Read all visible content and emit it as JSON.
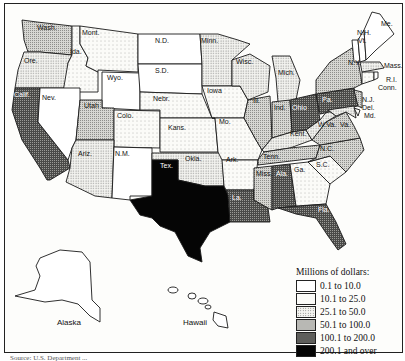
{
  "legend": {
    "title": "Millions of dollars:",
    "items": [
      {
        "label": "0.1 to 10.0",
        "pattern": "blank",
        "color": "#ffffff"
      },
      {
        "label": "10.1 to 25.0",
        "pattern": "sparse-dots",
        "color": "#f2f2ef"
      },
      {
        "label": "25.1 to 50.0",
        "pattern": "dense-dots",
        "color": "#e2e2dc"
      },
      {
        "label": "50.1 to 100.0",
        "pattern": "light-crosshatch",
        "color": "#bdbdb8"
      },
      {
        "label": "100.1 to 200.0",
        "pattern": "dark-crosshatch",
        "color": "#6a6a66"
      },
      {
        "label": "200.1 and over",
        "pattern": "solid",
        "color": "#050505"
      }
    ]
  },
  "insets": {
    "alaska": "Alaska",
    "hawaii": "Hawaii"
  },
  "source_text": "Source: U.S. Department ...",
  "states": {
    "wash": "Wash.",
    "ore": "Ore.",
    "calif": "Calif.",
    "ida": "Ida.",
    "nev": "Nev.",
    "mont": "Mont.",
    "wyo": "Wyo.",
    "utah": "Utah",
    "colo": "Colo.",
    "ariz": "Ariz.",
    "nm": "N.M.",
    "nd": "N.D.",
    "sd": "S.D.",
    "nebr": "Nebr.",
    "kans": "Kans.",
    "okla": "Okla.",
    "tex": "Tex.",
    "minn": "Minn.",
    "iowa": "Iowa",
    "mo": "Mo.",
    "ark": "Ark.",
    "la": "La.",
    "wisc": "Wisc.",
    "ill": "Ill.",
    "mich": "Mich.",
    "ind": "Ind.",
    "ohio": "Ohio",
    "kent": "Kent.",
    "tenn": "Tenn.",
    "miss": "Miss.",
    "ala": "Ala.",
    "ga": "Ga.",
    "fla": "Fla.",
    "sc": "S.C.",
    "nc": "N.C.",
    "va": "Va.",
    "wva": "W.Va.",
    "pa": "Pa.",
    "ny": "N.Y.",
    "nj": "N.J.",
    "del": "Del.",
    "md": "Md.",
    "conn": "Conn.",
    "ri": "R.I.",
    "mass": "Mass.",
    "vt": "Vt.",
    "nh": "N.H.",
    "me": "Me."
  },
  "categories_by_state": {
    "Wash.": "50.1 to 100.0",
    "Ore.": "25.1 to 50.0",
    "Calif.": "100.1 to 200.0",
    "Ida.": "10.1 to 25.0",
    "Nev.": "0.1 to 10.0",
    "Mont.": "10.1 to 25.0",
    "Wyo.": "0.1 to 10.0",
    "Utah": "50.1 to 100.0",
    "Colo.": "10.1 to 25.0",
    "Ariz.": "25.1 to 50.0",
    "N.M.": "0.1 to 10.0",
    "N.D.": "0.1 to 10.0",
    "S.D.": "0.1 to 10.0",
    "Nebr.": "10.1 to 25.0",
    "Kans.": "10.1 to 25.0",
    "Okla.": "25.1 to 50.0",
    "Tex.": "200.1 and over",
    "Minn.": "25.1 to 50.0",
    "Iowa": "10.1 to 25.0",
    "Mo.": "10.1 to 25.0",
    "Ark.": "10.1 to 25.0",
    "La.": "100.1 to 200.0",
    "Wisc.": "25.1 to 50.0",
    "Ill.": "50.1 to 100.0",
    "Mich.": "25.1 to 50.0",
    "Ind.": "50.1 to 100.0",
    "Ohio": "100.1 to 200.0",
    "Kent.": "25.1 to 50.0",
    "Tenn.": "50.1 to 100.0",
    "Miss.": "50.1 to 100.0",
    "Ala.": "100.1 to 200.0",
    "Ga.": "25.1 to 50.0",
    "Fla.": "100.1 to 200.0",
    "S.C.": "25.1 to 50.0",
    "N.C.": "50.1 to 100.0",
    "Va.": "50.1 to 100.0",
    "W.Va.": "25.1 to 50.0",
    "Pa.": "100.1 to 200.0",
    "N.Y.": "50.1 to 100.0",
    "N.J.": "50.1 to 100.0",
    "Del.": "10.1 to 25.0",
    "Md.": "25.1 to 50.0",
    "Conn.": "10.1 to 25.0",
    "R.I.": "0.1 to 10.0",
    "Mass.": "25.1 to 50.0",
    "Vt.": "0.1 to 10.0",
    "N.H.": "0.1 to 10.0",
    "Me.": "0.1 to 10.0",
    "Alaska": "0.1 to 10.0",
    "Hawaii": "0.1 to 10.0"
  }
}
